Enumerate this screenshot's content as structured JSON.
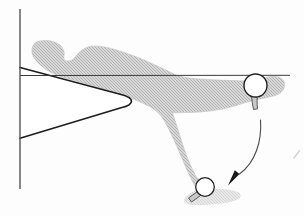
{
  "canvas": {
    "width": 304,
    "height": 216,
    "background": "#fdfdfd"
  },
  "palette": {
    "hatch_base": "#d8d8d8",
    "hatch_line": "#b2b2b2",
    "body_edge": "#c2c2c2",
    "wedge_fill": "#ffffff",
    "wedge_stroke": "#1e1e1e",
    "reference_line": "#3a3a3a",
    "wall_line": "#474747",
    "stem_fill": "#c8c8c8",
    "stem_stroke": "#4a4a4a",
    "ball_fill": "#ffffff",
    "ball_stroke": "#222222",
    "arrow_stroke": "#4a4a4a",
    "arrow_head": "#1a1a1a",
    "artifact": "#d6d6d6"
  },
  "figure": {
    "wall_line": {
      "x1": 20,
      "y1": 9,
      "x2": 20,
      "y2": 189
    },
    "reference_line": {
      "x1": 20,
      "y1": 75.5,
      "x2": 290,
      "y2": 75.3
    },
    "wedge": {
      "path": "M 20,67.5 L 121,94.5 C 135,98 135,104.3 121,107.8 L 20,138.2"
    },
    "body": {
      "path": "M 40,41 C 47,39.5 55,41 60,45 C 63,48 65,52 64,56 C 63,59 65,61 68,61 C 71,61 74,59 76,56 C 79,52 83,48.5 89,46.5 C 97,45.5 106,46.5 115,49.5 C 128,53.5 142,58.5 154,64.5 C 161,67.5 169,71.5 176,75 C 181,77 188,78 196,78.8 C 212,80 230,80.5 246,81 C 252,81.2 258,80 263,78 C 269,76.5 276,76 280,77.5 C 283,79 285,82 284.5,86 C 284,90 281,93.5 276,95.2 C 270,97 263,98.5 256,99.8 C 248,101.5 240,104.5 231,107 C 218,110.5 204,112 190,112.5 C 184,112.7 178,112.5 172.5,112.8 C 175.5,122 180,136 184.5,150 C 188,160 192.5,170.5 197,178 L 203.5,182 C 203,185.5 199,187.5 195,186 C 192,181 188,172.5 183.5,162 C 178,148.5 171,133 164.5,121 C 161,114.5 156,110 149.5,106.5 C 142,102.5 132,98.5 124.5,95.8 C 106,89.5 86,83.5 67,78.5 C 59,76.3 52.5,73.5 47.5,70.5 C 42,67 36.5,62 33.5,57 C 31,52.5 31.5,46.5 34.5,43.5 C 36,42 38,41.3 40,41 Z"
    },
    "foot_shadow": {
      "path": "M 184,200 C 186,194.5 193,191 201,189.8 C 212,188.2 224,188.8 233,190.5 C 238,191.5 241.5,193.5 240.5,196.5 C 239,200.5 230,202.5 219,203.8 C 208,205 196,206 189.5,204.5 C 185.5,203.5 183,202 184,200 Z"
    },
    "upper_stem": {
      "path": "M 251.5,95.5 C 251.8,100 252.5,105 253.5,109.5 L 257.5,108.8 C 257,103.5 257,98.5 257.2,94.5 Z"
    },
    "lower_stem": {
      "path": "M 197.5,191.5 L 200.5,195.5 L 191.5,202 L 188.5,198 Z"
    },
    "balls": [
      {
        "cx": 255.5,
        "cy": 85.5,
        "r": 11.5
      },
      {
        "cx": 205,
        "cy": 187,
        "r": 9.3
      }
    ],
    "swing_arrow": {
      "arc_path": "M 260.5,120 C 262,141 255.5,162.5 239.5,174",
      "head_points": "228,185.5 239.5,174 234.8,170.3"
    },
    "artifact_dash": {
      "path": "M 294,158 Q 297.5,153.5 299.5,150.5"
    }
  }
}
